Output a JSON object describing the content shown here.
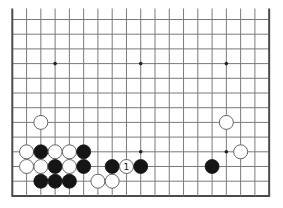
{
  "diagram": {
    "board_size": 19,
    "visible_rows": 13,
    "open_edge": "top",
    "geometry": {
      "x0": 12.3,
      "dx": 14.27,
      "y0": 19.5,
      "dy": 14.7,
      "top_extend": 11,
      "stone_radius": 7
    },
    "colors": {
      "grid": "#7a7a7a",
      "edge": "#4a4a4a",
      "black": "#151515",
      "white": "#ffffff",
      "white_outline": "#555555"
    },
    "star_points": [
      {
        "col": 3,
        "row": 3
      },
      {
        "col": 9,
        "row": 3
      },
      {
        "col": 15,
        "row": 3
      },
      {
        "col": 3,
        "row": 9
      },
      {
        "col": 9,
        "row": 9
      },
      {
        "col": 15,
        "row": 9
      }
    ],
    "stones": [
      {
        "color": "white",
        "col": 2,
        "row": 7,
        "label": ""
      },
      {
        "color": "white",
        "col": 15,
        "row": 7,
        "label": ""
      },
      {
        "color": "white",
        "col": 1,
        "row": 9,
        "label": ""
      },
      {
        "color": "black",
        "col": 2,
        "row": 9,
        "label": ""
      },
      {
        "color": "white",
        "col": 3,
        "row": 9,
        "label": ""
      },
      {
        "color": "white",
        "col": 4,
        "row": 9,
        "label": ""
      },
      {
        "color": "black",
        "col": 5,
        "row": 9,
        "label": ""
      },
      {
        "color": "white",
        "col": 16,
        "row": 9,
        "label": ""
      },
      {
        "color": "white",
        "col": 1,
        "row": 10,
        "label": ""
      },
      {
        "color": "white",
        "col": 2,
        "row": 10,
        "label": ""
      },
      {
        "color": "black",
        "col": 3,
        "row": 10,
        "label": ""
      },
      {
        "color": "white",
        "col": 4,
        "row": 10,
        "label": ""
      },
      {
        "color": "black",
        "col": 5,
        "row": 10,
        "label": ""
      },
      {
        "color": "black",
        "col": 7,
        "row": 10,
        "label": ""
      },
      {
        "color": "white",
        "col": 8,
        "row": 10,
        "label": "1"
      },
      {
        "color": "black",
        "col": 9,
        "row": 10,
        "label": ""
      },
      {
        "color": "black",
        "col": 14,
        "row": 10,
        "label": ""
      },
      {
        "color": "black",
        "col": 2,
        "row": 11,
        "label": ""
      },
      {
        "color": "black",
        "col": 3,
        "row": 11,
        "label": ""
      },
      {
        "color": "black",
        "col": 4,
        "row": 11,
        "label": ""
      },
      {
        "color": "white",
        "col": 6,
        "row": 11,
        "label": ""
      },
      {
        "color": "white",
        "col": 7,
        "row": 11,
        "label": ""
      }
    ]
  }
}
